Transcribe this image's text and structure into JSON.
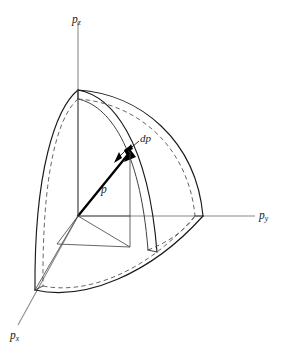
{
  "figure": {
    "kind": "3d-momentum-space-spherical-shell-octant",
    "background_color": "#ffffff",
    "axis_color": "#8a8a8a",
    "outline_color": "#1a1a1a",
    "hidden_line_color": "#555555",
    "vector_color": "#000000"
  },
  "axes": {
    "pz": {
      "base": "p",
      "sub": "z"
    },
    "py": {
      "base": "p",
      "sub": "y"
    },
    "px": {
      "base": "p",
      "sub": "x"
    }
  },
  "annotations": {
    "radius_vector": "p",
    "shell_thickness": "dp"
  },
  "geometry": {
    "origin": [
      78,
      216
    ],
    "pz_axis_end": [
      78,
      22
    ],
    "py_axis_end": [
      255,
      216
    ],
    "px_axis_end": [
      18,
      325
    ],
    "pz_shell_apex": [
      78,
      90
    ],
    "py_shell_edge": [
      203,
      216
    ],
    "px_shell_edge": [
      35,
      290
    ],
    "outer_radius_px": 126,
    "shell_thickness_px": 9,
    "vector_tip": [
      130,
      150
    ]
  }
}
